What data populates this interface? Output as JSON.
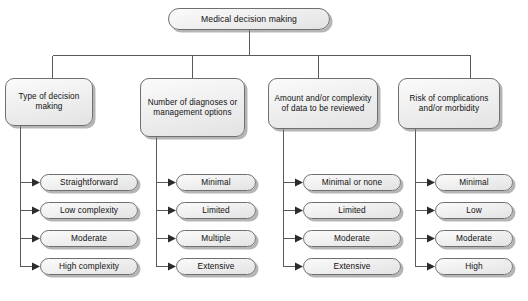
{
  "diagram": {
    "title": "Medical decision making",
    "root": {
      "label": "Medical decision making"
    },
    "categories": [
      {
        "label": "Type of decision making",
        "leaves": [
          {
            "label": "Straightforward"
          },
          {
            "label": "Low complexity"
          },
          {
            "label": "Moderate"
          },
          {
            "label": "High complexity"
          }
        ]
      },
      {
        "label": "Number of diagnoses or management options",
        "leaves": [
          {
            "label": "Minimal"
          },
          {
            "label": "Limited"
          },
          {
            "label": "Multiple"
          },
          {
            "label": "Extensive"
          }
        ]
      },
      {
        "label": "Amount and/or complexity of data to be reviewed",
        "leaves": [
          {
            "label": "Minimal or none"
          },
          {
            "label": "Limited"
          },
          {
            "label": "Moderate"
          },
          {
            "label": "Extensive"
          }
        ]
      },
      {
        "label": "Risk of complications and/or morbidity",
        "leaves": [
          {
            "label": "Minimal"
          },
          {
            "label": "Low"
          },
          {
            "label": "Moderate"
          },
          {
            "label": "High"
          }
        ]
      }
    ],
    "colors": {
      "box_fill": "#f0f0f0",
      "box_border": "#6f6f6f",
      "box_shadow": "#9a9a9a",
      "connector": "#5a5a5a",
      "text": "#111111",
      "background": "#ffffff"
    }
  }
}
